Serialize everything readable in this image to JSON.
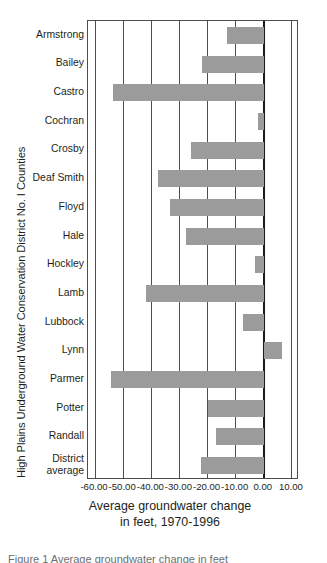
{
  "chart_data": {
    "type": "bar",
    "orientation": "horizontal",
    "title": "",
    "xlabel": "Average groundwater change\nin feet, 1970-1996",
    "xlabel_line1": "Average groundwater change",
    "xlabel_line2": "in feet, 1970-1996",
    "ylabel": "High Plains Underground Water Conservation District No. I Counties",
    "categories": [
      "Armstrong",
      "Bailey",
      "Castro",
      "Cochran",
      "Crosby",
      "Deaf Smith",
      "Floyd",
      "Hale",
      "Hockley",
      "Lamb",
      "Lubbock",
      "Lynn",
      "Parmer",
      "Potter",
      "Randall",
      "District average"
    ],
    "values": [
      -13.0,
      -22.0,
      -53.5,
      -2.0,
      -26.0,
      -37.5,
      -33.5,
      -27.5,
      -3.0,
      -42.0,
      -7.5,
      6.5,
      -54.5,
      -20.0,
      -17.0,
      -22.5
    ],
    "xlim": [
      -62.5,
      12.5
    ],
    "xticks": [
      -60,
      -50,
      -40,
      -30,
      -20,
      -10,
      0,
      10
    ],
    "xticklabels": [
      "-60.00",
      "-50.00",
      "-40.00",
      "-30.00",
      "-20.00",
      "-10.00",
      "0.00",
      "10.00"
    ],
    "grid": "vertical",
    "legend": "none",
    "bar_color": "#9b9b9b",
    "axis_color": "#4d4d4d",
    "zero_line_color": "#1a1a1a"
  },
  "caption": {
    "clipped_text": "Figure 1 Average groundwater change in feet"
  }
}
